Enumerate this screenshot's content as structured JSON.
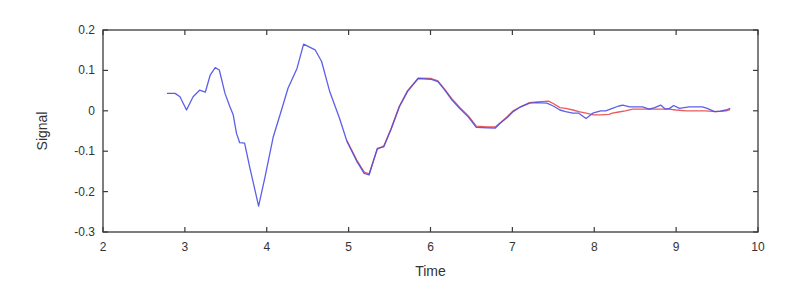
{
  "chart_data": {
    "type": "line",
    "title": "",
    "xlabel": "Time",
    "ylabel": "Signal",
    "xlim": [
      2,
      10
    ],
    "ylim": [
      -0.3,
      0.2
    ],
    "xticks": [
      2,
      3,
      4,
      5,
      6,
      7,
      8,
      9,
      10
    ],
    "xtick_labels": [
      "2",
      "3",
      "4",
      "5",
      "6",
      "7",
      "8",
      "9",
      "10"
    ],
    "yticks": [
      0.2,
      0.1,
      0,
      -0.1,
      -0.2,
      -0.3
    ],
    "ytick_labels": [
      "0.2",
      "0.1",
      "0",
      "-0.1",
      "-0.2",
      "-0.3"
    ],
    "grid": false,
    "legend": null,
    "series": [
      {
        "name": "measured",
        "color": "#4a4ee6",
        "x": [
          2.78,
          2.88,
          2.94,
          3.02,
          3.1,
          3.18,
          3.25,
          3.31,
          3.37,
          3.42,
          3.49,
          3.55,
          3.59,
          3.63,
          3.67,
          3.73,
          3.79,
          3.9,
          3.98,
          4.08,
          4.18,
          4.26,
          4.37,
          4.45,
          4.59,
          4.67,
          4.77,
          4.89,
          4.98,
          5.1,
          5.19,
          5.25,
          5.35,
          5.43,
          5.52,
          5.62,
          5.72,
          5.85,
          6.01,
          6.09,
          6.18,
          6.26,
          6.36,
          6.46,
          6.56,
          6.69,
          6.79,
          6.85,
          6.93,
          7.01,
          7.1,
          7.21,
          7.3,
          7.42,
          7.5,
          7.58,
          7.65,
          7.74,
          7.81,
          7.9,
          7.99,
          8.08,
          8.14,
          8.22,
          8.3,
          8.35,
          8.43,
          8.51,
          8.59,
          8.67,
          8.74,
          8.81,
          8.87,
          8.92,
          8.97,
          9.04,
          9.1,
          9.16,
          9.24,
          9.32,
          9.38,
          9.47,
          9.54,
          9.61,
          9.66
        ],
        "y": [
          0.043,
          0.043,
          0.035,
          0.002,
          0.035,
          0.051,
          0.046,
          0.089,
          0.107,
          0.101,
          0.043,
          0.01,
          -0.01,
          -0.056,
          -0.079,
          -0.08,
          -0.138,
          -0.236,
          -0.163,
          -0.064,
          0.002,
          0.056,
          0.105,
          0.165,
          0.151,
          0.122,
          0.047,
          -0.019,
          -0.076,
          -0.125,
          -0.155,
          -0.159,
          -0.093,
          -0.089,
          -0.045,
          0.01,
          0.048,
          0.08,
          0.078,
          0.072,
          0.05,
          0.027,
          0.005,
          -0.015,
          -0.041,
          -0.042,
          -0.043,
          -0.031,
          -0.018,
          -0.002,
          0.01,
          0.019,
          0.02,
          0.019,
          0.012,
          0.002,
          -0.002,
          -0.006,
          -0.006,
          -0.019,
          -0.005,
          0.0,
          0.0,
          0.006,
          0.012,
          0.014,
          0.01,
          0.01,
          0.01,
          0.004,
          0.008,
          0.014,
          0.004,
          0.006,
          0.013,
          0.006,
          0.008,
          0.01,
          0.01,
          0.01,
          0.006,
          -0.002,
          -0.001,
          0.002,
          0.006
        ]
      },
      {
        "name": "model",
        "color": "#e84848",
        "x": [
          4.98,
          5.1,
          5.19,
          5.25,
          5.35,
          5.43,
          5.52,
          5.62,
          5.72,
          5.85,
          6.01,
          6.09,
          6.18,
          6.26,
          6.36,
          6.46,
          6.56,
          6.69,
          6.79,
          6.85,
          6.93,
          7.01,
          7.1,
          7.21,
          7.3,
          7.44,
          7.5,
          7.58,
          7.65,
          7.74,
          7.81,
          7.9,
          7.99,
          8.08,
          8.18,
          8.22,
          8.3,
          8.38,
          8.47,
          8.59,
          8.7,
          8.8,
          8.91,
          9.0,
          9.12,
          9.24,
          9.36,
          9.49,
          9.61,
          9.66
        ],
        "y": [
          -0.074,
          -0.122,
          -0.152,
          -0.156,
          -0.095,
          -0.087,
          -0.043,
          0.012,
          0.05,
          0.081,
          0.08,
          0.074,
          0.052,
          0.03,
          0.008,
          -0.012,
          -0.038,
          -0.04,
          -0.04,
          -0.03,
          -0.016,
          0.0,
          0.01,
          0.02,
          0.022,
          0.024,
          0.018,
          0.008,
          0.006,
          0.002,
          -0.002,
          -0.006,
          -0.01,
          -0.01,
          -0.009,
          -0.006,
          -0.003,
          0.0,
          0.004,
          0.004,
          0.004,
          0.004,
          0.004,
          0.002,
          0.0,
          0.0,
          0.0,
          -0.002,
          0.0,
          0.003
        ]
      }
    ]
  }
}
